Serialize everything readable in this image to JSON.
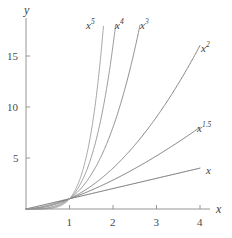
{
  "figure": {
    "width": 232,
    "height": 238,
    "background_color": "#ffffff"
  },
  "axes": {
    "x_name": "x",
    "y_name": "y",
    "axis_color": "#8a8a8a",
    "tick_color": "#8a8a8a",
    "label_color": "#4a4a4a",
    "origin_px": {
      "x": 26,
      "y": 209
    },
    "x_unit_px": 43.5,
    "y_unit_px": 10.22,
    "x_axis_end_px": 210,
    "y_axis_top_px": 18,
    "x_ticks": [
      {
        "value": 1,
        "label": "1",
        "px": 69.5
      },
      {
        "value": 2,
        "label": "2",
        "px": 113
      },
      {
        "value": 3,
        "label": "3",
        "px": 156.5
      },
      {
        "value": 4,
        "label": "4",
        "px": 200
      }
    ],
    "y_ticks": [
      {
        "value": 5,
        "label": "5",
        "px": 158
      },
      {
        "value": 10,
        "label": "10",
        "px": 107
      },
      {
        "value": 15,
        "label": "15",
        "px": 56
      }
    ]
  },
  "chart_data": {
    "type": "line",
    "title": "",
    "xlabel": "x",
    "ylabel": "y",
    "xlim": [
      0,
      4.2
    ],
    "ylim": [
      0,
      18.5
    ],
    "grid": false,
    "legend": "inline-curve-labels",
    "annotations": [
      {
        "text": "x",
        "exponent": "",
        "x_px": 206,
        "y_px": 165,
        "for_series": "x"
      },
      {
        "text": "x",
        "exponent": "1.5",
        "x_px": 197,
        "y_px": 123,
        "for_series": "x^1.5"
      },
      {
        "text": "x",
        "exponent": "2",
        "x_px": 201,
        "y_px": 43,
        "for_series": "x^2"
      },
      {
        "text": "x",
        "exponent": "3",
        "x_px": 140,
        "y_px": 20,
        "for_series": "x^3"
      },
      {
        "text": "x",
        "exponent": "4",
        "x_px": 115,
        "y_px": 20,
        "for_series": "x^4"
      },
      {
        "text": "x",
        "exponent": "5",
        "x_px": 86,
        "y_px": 20,
        "for_series": "x^5"
      }
    ],
    "series": [
      {
        "name": "x",
        "label": "x",
        "exponent": 1,
        "color": "#6b6b6b",
        "width": 1.0,
        "x_end": 4.0,
        "y_end": 4.0,
        "x": [
          0,
          0.25,
          0.5,
          0.75,
          1.0,
          1.5,
          2.0,
          2.5,
          3.0,
          3.5,
          4.0
        ],
        "values": [
          0,
          0.25,
          0.5,
          0.75,
          1.0,
          1.5,
          2.0,
          2.5,
          3.0,
          3.5,
          4.0
        ]
      },
      {
        "name": "x^1.5",
        "label": "x",
        "exponent": 1.5,
        "color": "#7a7a7a",
        "width": 1.0,
        "x_end": 4.0,
        "y_end": 8.0,
        "x": [
          0,
          0.25,
          0.5,
          0.75,
          1.0,
          1.5,
          2.0,
          2.5,
          3.0,
          3.5,
          4.0
        ],
        "values": [
          0,
          0.125,
          0.354,
          0.65,
          1.0,
          1.837,
          2.828,
          3.953,
          5.196,
          6.548,
          8.0
        ]
      },
      {
        "name": "x^2",
        "label": "x",
        "exponent": 2,
        "color": "#858585",
        "width": 1.0,
        "x_end": 4.0,
        "y_end": 16.0,
        "x": [
          0,
          0.25,
          0.5,
          0.75,
          1.0,
          1.5,
          2.0,
          2.5,
          3.0,
          3.5,
          4.0
        ],
        "values": [
          0,
          0.0625,
          0.25,
          0.5625,
          1.0,
          2.25,
          4.0,
          6.25,
          9.0,
          12.25,
          16.0
        ]
      },
      {
        "name": "x^3",
        "label": "x",
        "exponent": 3,
        "color": "#909090",
        "width": 1.0,
        "x_end": 2.62,
        "y_end": 18.0,
        "x": [
          0,
          0.25,
          0.5,
          0.75,
          1.0,
          1.25,
          1.5,
          1.75,
          2.0,
          2.25,
          2.5,
          2.62
        ],
        "values": [
          0,
          0.016,
          0.125,
          0.422,
          1.0,
          1.953,
          3.375,
          5.359,
          8.0,
          11.39,
          15.63,
          18.0
        ]
      },
      {
        "name": "x^4",
        "label": "x",
        "exponent": 4,
        "color": "#9c9c9c",
        "width": 1.0,
        "x_end": 2.06,
        "y_end": 18.0,
        "x": [
          0,
          0.25,
          0.5,
          0.75,
          1.0,
          1.25,
          1.5,
          1.75,
          2.0,
          2.06
        ],
        "values": [
          0,
          0.004,
          0.0625,
          0.316,
          1.0,
          2.441,
          5.063,
          9.379,
          16.0,
          18.0
        ]
      },
      {
        "name": "x^5",
        "label": "x",
        "exponent": 5,
        "color": "#a8a8a8",
        "width": 1.0,
        "x_end": 1.78,
        "y_end": 18.0,
        "x": [
          0,
          0.25,
          0.5,
          0.75,
          1.0,
          1.15,
          1.3,
          1.45,
          1.6,
          1.78
        ],
        "values": [
          0,
          0.001,
          0.031,
          0.237,
          1.0,
          2.011,
          3.713,
          6.409,
          10.49,
          18.0
        ]
      }
    ],
    "common_point": {
      "x": 1,
      "y": 1,
      "note": "all curves intersect at (1,1)"
    }
  }
}
